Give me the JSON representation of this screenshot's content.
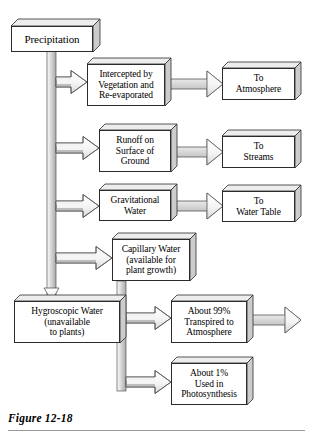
{
  "figure": {
    "caption": "Figure 12-18",
    "type": "flow-diagram"
  },
  "colors": {
    "box_fill": "#ffffff",
    "box_stroke": "#2b2b2b",
    "face_top": "#e8e8e8",
    "face_side": "#cfcfcf",
    "arrow_fill_light": "#f2f2f2",
    "arrow_fill_dark": "#a8a8a8",
    "arrow_stroke": "#4a4a4a",
    "rule": "#9a9a9a",
    "text": "#000000",
    "page_background": "#ffffff"
  },
  "nodes": {
    "precipitation": {
      "label": "Precipitation",
      "x": 11,
      "y": 26,
      "w": 82,
      "h": 26,
      "font": 11
    },
    "intercepted": {
      "label": "Intercepted by\nVegetation and\nRe-evaporated",
      "x": 87,
      "y": 64,
      "w": 78,
      "h": 42,
      "font": 9.5
    },
    "to_atmosphere": {
      "label": "To\nAtmosphere",
      "x": 222,
      "y": 68,
      "w": 73,
      "h": 32,
      "font": 9.5
    },
    "runoff": {
      "label": "Runoff on\nSurface of\nGround",
      "x": 99,
      "y": 130,
      "w": 72,
      "h": 42,
      "font": 9.5
    },
    "to_streams": {
      "label": "To\nStreams",
      "x": 222,
      "y": 136,
      "w": 73,
      "h": 32,
      "font": 9.5
    },
    "gravitational": {
      "label": "Gravitational\nWater",
      "x": 99,
      "y": 190,
      "w": 72,
      "h": 31,
      "font": 9.5
    },
    "to_water_table": {
      "label": "To\nWater Table",
      "x": 222,
      "y": 191,
      "w": 73,
      "h": 31,
      "font": 9.5
    },
    "capillary": {
      "label": "Capillary Water\n(available for\nplant growth)",
      "x": 112,
      "y": 239,
      "w": 78,
      "h": 42,
      "font": 9.5
    },
    "hygroscopic": {
      "label": "Hygroscopic Water\n(unavailable\nto plants)",
      "x": 14,
      "y": 301,
      "w": 106,
      "h": 42,
      "font": 9.5
    },
    "transpired": {
      "label": "About 99%\nTranspired to\nAtmosphere",
      "x": 171,
      "y": 301,
      "w": 76,
      "h": 42,
      "font": 9.5
    },
    "photosynthesis": {
      "label": "About 1%\nUsed in\nPhotosynthesis",
      "x": 171,
      "y": 363,
      "w": 76,
      "h": 42,
      "font": 9.5
    }
  },
  "flows": [
    {
      "id": "precipitation-trunk",
      "from": "precipitation",
      "to": "hygroscopic",
      "kind": "vertical-trunk"
    },
    {
      "id": "trunk-to-intercepted",
      "from": "precipitation",
      "to": "intercepted",
      "kind": "branch-right"
    },
    {
      "id": "intercepted-to-atmosphere",
      "from": "intercepted",
      "to": "to_atmosphere",
      "kind": "straight-right"
    },
    {
      "id": "trunk-to-runoff",
      "from": "precipitation",
      "to": "runoff",
      "kind": "branch-right"
    },
    {
      "id": "runoff-to-streams",
      "from": "runoff",
      "to": "to_streams",
      "kind": "straight-right"
    },
    {
      "id": "trunk-to-gravitational",
      "from": "precipitation",
      "to": "gravitational",
      "kind": "branch-right"
    },
    {
      "id": "gravitational-to-water-table",
      "from": "gravitational",
      "to": "to_water_table",
      "kind": "straight-right"
    },
    {
      "id": "trunk-to-capillary",
      "from": "precipitation",
      "to": "capillary",
      "kind": "branch-right"
    },
    {
      "id": "trunk-to-hygroscopic",
      "from": "precipitation",
      "to": "hygroscopic",
      "kind": "arrow-down"
    },
    {
      "id": "capillary-to-transpired",
      "from": "capillary",
      "to": "transpired",
      "kind": "branch-right"
    },
    {
      "id": "capillary-to-photosynthesis",
      "from": "capillary",
      "to": "photosynthesis",
      "kind": "branch-right"
    },
    {
      "id": "transpired-outflow",
      "from": "transpired",
      "to": null,
      "kind": "straight-right-open"
    }
  ]
}
